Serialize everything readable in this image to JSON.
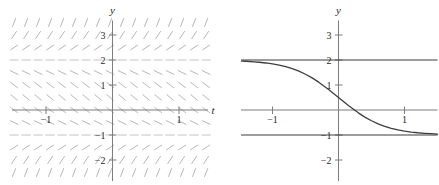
{
  "figure": {
    "colors": {
      "background": "#ffffff",
      "axis": "#7d7d7d",
      "ink": "#3d3d3d",
      "slope_marks": "#b6b6b6",
      "labels": "#1f1f1f"
    }
  },
  "chart_data": [
    {
      "type": "slope_field",
      "title": "",
      "xlabel": "t",
      "ylabel": "y",
      "xlim": [
        -1.52,
        1.45
      ],
      "ylim": [
        -2.9,
        3.55
      ],
      "x_ticks": [
        {
          "value": -1,
          "label": "−1"
        },
        {
          "value": 1,
          "label": "1"
        }
      ],
      "y_ticks": [
        {
          "value": 3,
          "label": "3"
        },
        {
          "value": 2,
          "label": "2"
        },
        {
          "value": 1,
          "label": "1"
        },
        {
          "value": -1,
          "label": "−1"
        },
        {
          "value": -2,
          "label": "−2"
        }
      ],
      "equilibria": [
        2,
        -1
      ],
      "slope_pattern": "slopes zero at y = 2 and y = −1, negative between them, positive outside",
      "grid": {
        "t_min": -1.48,
        "t_step": 0.1805,
        "t_count": 17,
        "y_max": 3.5,
        "y_step": 0.5,
        "y_count": 13
      },
      "mark_length_px": 8.5
    },
    {
      "type": "line",
      "title": "",
      "xlabel": "",
      "ylabel": "y",
      "xlim": [
        -1.47,
        1.5
      ],
      "ylim": [
        -2.9,
        3.55
      ],
      "x_ticks": [
        {
          "value": -1,
          "label": "−1"
        },
        {
          "value": 1,
          "label": "1"
        }
      ],
      "y_ticks": [
        {
          "value": 3,
          "label": "3"
        },
        {
          "value": 2,
          "label": "2"
        },
        {
          "value": 1,
          "label": "1"
        },
        {
          "value": -1,
          "label": "−1"
        },
        {
          "value": -2,
          "label": "−2"
        }
      ],
      "equilibrium_lines": [
        2,
        -1
      ],
      "series": [
        {
          "name": "solution-curve",
          "x": [
            -1.47,
            -1.4,
            -1.28,
            -1.2,
            -1.1,
            -1.0,
            -0.9,
            -0.8,
            -0.7,
            -0.6,
            -0.5,
            -0.4,
            -0.3,
            -0.15,
            -0.08,
            0,
            0.08,
            0.15,
            0.3,
            0.4,
            0.5,
            0.6,
            0.7,
            0.8,
            0.9,
            1.0,
            1.1,
            1.2,
            1.3,
            1.4,
            1.5
          ],
          "y": [
            1.958,
            1.949,
            1.928,
            1.91,
            1.881,
            1.843,
            1.795,
            1.732,
            1.652,
            1.552,
            1.43,
            1.284,
            1.114,
            0.821,
            0.673,
            0.5,
            0.327,
            0.179,
            -0.114,
            -0.284,
            -0.43,
            -0.552,
            -0.652,
            -0.732,
            -0.795,
            -0.843,
            -0.881,
            -0.91,
            -0.932,
            -0.949,
            -0.961
          ]
        }
      ]
    }
  ]
}
